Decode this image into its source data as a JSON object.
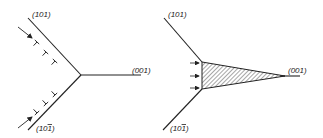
{
  "left_diagram": {
    "labels": {
      "upper_plane": "(101)",
      "right_plane": "(001)",
      "lower_plane": "(10",
      "lower_plane_bar_digit": "1",
      "lower_plane_close": ")"
    },
    "dislocation_symbols_upper": [
      "T",
      "T",
      "T"
    ],
    "dislocation_symbols_lower": [
      "⊥",
      "⊥",
      "⊥"
    ]
  },
  "right_diagram": {
    "labels": {
      "upper_plane": "(101)",
      "right_plane": "(001)",
      "lower_plane": "(10",
      "lower_plane_bar_digit": "1",
      "lower_plane_close": ")"
    },
    "arrow_count": 3,
    "hatched_region": "wedge"
  },
  "colors": {
    "line": "#222222",
    "background": "#ffffff"
  }
}
